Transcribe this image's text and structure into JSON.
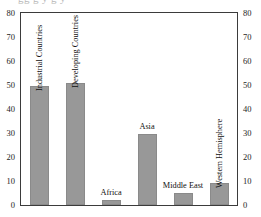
{
  "chart_data": {
    "type": "bar",
    "title": "",
    "xlabel": "",
    "ylabel": "",
    "ylim": [
      0,
      80
    ],
    "yticks": [
      0,
      10,
      20,
      30,
      40,
      50,
      60,
      70,
      80
    ],
    "dual_axis": true,
    "grid": false,
    "legend": null,
    "bar_color": "#989898",
    "categories": [
      "Industrial Countries",
      "Developing Countries",
      "Africa",
      "Asia",
      "Middle East",
      "Western Hemisphere"
    ],
    "values": [
      49.5,
      51,
      2,
      29.5,
      5,
      9
    ],
    "label_orientation": [
      "vertical",
      "vertical",
      "horizontal",
      "horizontal",
      "horizontal",
      "vertical"
    ]
  },
  "axes": {
    "left_ticks": [
      "80",
      "70",
      "60",
      "50",
      "40",
      "30",
      "20",
      "10",
      "0"
    ],
    "right_ticks": [
      "80",
      "70",
      "60",
      "50",
      "40",
      "30",
      "20",
      "10",
      "0"
    ]
  },
  "title_fragment": "gg  g  y  g  y"
}
